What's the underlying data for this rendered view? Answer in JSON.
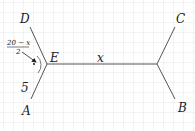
{
  "diagram": {
    "type": "geometry",
    "grid": {
      "spacing": 10,
      "color": "#d6d6d6"
    },
    "line_color": "#555555",
    "points": {
      "D": {
        "label": "D"
      },
      "E": {
        "label": "E"
      },
      "A": {
        "label": "A"
      },
      "C": {
        "label": "C"
      },
      "B": {
        "label": "B"
      }
    },
    "segment_labels": {
      "EF": "x",
      "AE": "5"
    },
    "fraction": {
      "numerator": "20 − x",
      "denominator": "2"
    },
    "angle_marker": "•"
  }
}
